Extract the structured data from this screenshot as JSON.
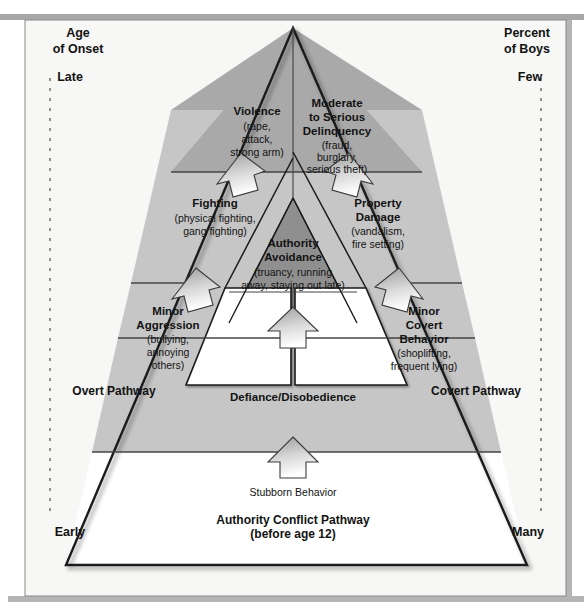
{
  "figure": {
    "background_color": "#ffffff",
    "panel_color": "#f7f7f5",
    "top_bar_color": "#a8a8a8"
  },
  "axes": {
    "left": {
      "heading_line1": "Age",
      "heading_line2": "of Onset",
      "top_label": "Late",
      "bottom_label": "Early"
    },
    "right": {
      "heading_line1": "Percent",
      "heading_line2": "of Boys",
      "top_label": "Few",
      "bottom_label": "Many"
    }
  },
  "pathways": [
    {
      "id": "overt",
      "name": "Overt Pathway",
      "side": "left",
      "fill": "#ffffff",
      "stages": [
        {
          "order": 3,
          "title": "Violence",
          "detail": "(rape, attack, strong arm)",
          "detail_lines": [
            "(rape,",
            "attack,",
            "strong arm)"
          ],
          "fill": "#a9a9a9"
        },
        {
          "order": 2,
          "title": "Fighting",
          "detail": "(physical fighting, gang fighting)",
          "detail_lines": [
            "(physical fighting,",
            "gang fighting)"
          ],
          "fill": "#c6c6c6"
        },
        {
          "order": 1,
          "title": "Minor Aggression",
          "title_lines": [
            "Minor",
            "Aggression"
          ],
          "detail": "(bullying, annoying others)",
          "detail_lines": [
            "(bullying,",
            "annoying",
            "others)"
          ],
          "fill": "#ffffff"
        }
      ]
    },
    {
      "id": "covert",
      "name": "Covert Pathway",
      "side": "right",
      "fill": "#ffffff",
      "stages": [
        {
          "order": 3,
          "title": "Moderate to Serious Delinquency",
          "title_lines": [
            "Moderate",
            "to Serious",
            "Delinquency"
          ],
          "detail": "(fraud, burglary, serious theft)",
          "detail_lines": [
            "(fraud,",
            "burglary,",
            "serious theft)"
          ],
          "fill": "#a9a9a9"
        },
        {
          "order": 2,
          "title": "Property Damage",
          "title_lines": [
            "Property",
            "Damage"
          ],
          "detail": "(vandalism, fire setting)",
          "detail_lines": [
            "(vandalism,",
            "fire setting)"
          ],
          "fill": "#c6c6c6"
        },
        {
          "order": 1,
          "title": "Minor Covert Behavior",
          "title_lines": [
            "Minor",
            "Covert",
            "Behavior"
          ],
          "detail": "(shoplifting, frequent lying)",
          "detail_lines": [
            "(shoplifting,",
            "frequent lying)"
          ],
          "fill": "#ffffff"
        }
      ]
    },
    {
      "id": "authority-conflict",
      "name": "Authority Conflict Pathway",
      "name_sub": "(before age 12)",
      "side": "center",
      "stages": [
        {
          "order": 3,
          "title": "Authority Avoidance",
          "title_lines": [
            "Authority",
            "Avoidance"
          ],
          "detail": "(truancy, running away, staying out late)",
          "detail_lines": [
            "(truancy, running",
            "away, staying out late)"
          ],
          "fill": "#8f8f8f"
        },
        {
          "order": 2,
          "title": "Defiance/Disobedience",
          "detail": "",
          "detail_lines": [],
          "fill": "#c6c6c6"
        },
        {
          "order": 1,
          "title": "Stubborn Behavior",
          "detail": "",
          "detail_lines": [],
          "fill": "#ffffff"
        }
      ]
    }
  ],
  "arrows": {
    "count": 7,
    "semantic": "progression-arrow-up",
    "fill_top": "#9a9a9a",
    "fill_bottom": "#ffffff"
  },
  "colors": {
    "outline": "#1a1a1a",
    "divider": "#555555",
    "dashed_axis": "#777777",
    "tier3": "#a9a9a9",
    "tier3_center": "#8f8f8f",
    "tier2": "#c6c6c6",
    "tier1": "#ffffff"
  }
}
